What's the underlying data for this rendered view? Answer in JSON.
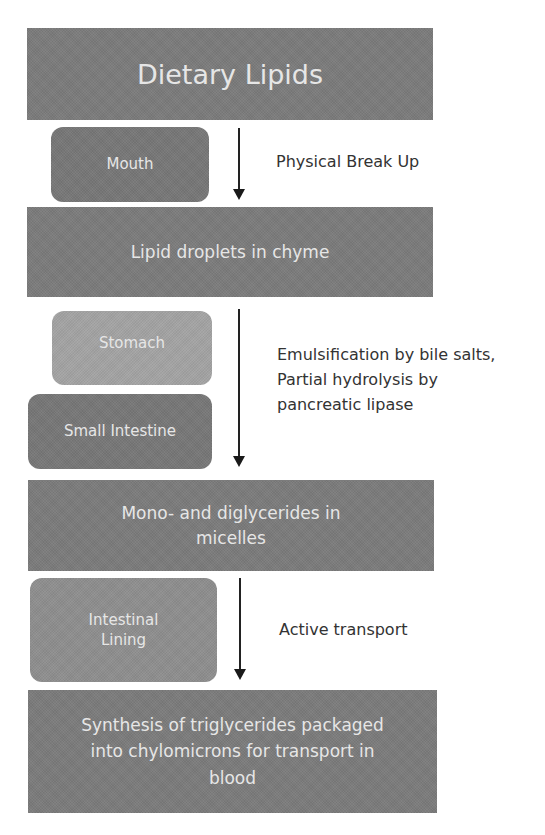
{
  "diagram": {
    "title": "Dietary Lipids",
    "stages": [
      {
        "id": "dietary-lipids",
        "text": "Dietary Lipids"
      },
      {
        "id": "lipid-droplets",
        "text": "Lipid droplets in chyme"
      },
      {
        "id": "mono-diglycerides",
        "text": "Mono- and diglycerides in micelles"
      },
      {
        "id": "synthesis-triglycerides",
        "text": "Synthesis of triglycerides packaged into chylomicrons for transport in blood"
      }
    ],
    "locations": [
      {
        "id": "mouth",
        "text": "Mouth"
      },
      {
        "id": "stomach",
        "text": "Stomach"
      },
      {
        "id": "small-intestine",
        "text": "Small Intestine"
      },
      {
        "id": "intestinal-lining",
        "text": "Intestinal Lining"
      }
    ],
    "processes": [
      {
        "id": "physical-break-up",
        "text": "Physical Break Up"
      },
      {
        "id": "emulsification",
        "text": "Emulsification by bile salts, Partial hydrolysis by pancreatic lipase"
      },
      {
        "id": "active-transport",
        "text": "Active transport"
      }
    ],
    "colors": {
      "stage_box": "#7b7b7b",
      "location_dark": "#777777",
      "location_light": "#a3a3a3",
      "location_mid": "#8e8e8e",
      "box_text": "#e6e6e6",
      "label_text": "#333333",
      "arrow": "#1a1a1a"
    }
  }
}
